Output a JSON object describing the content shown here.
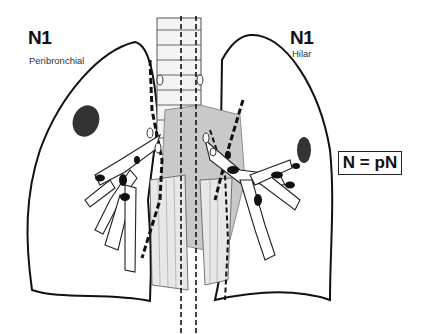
{
  "left_label": {
    "title": "N1",
    "subtitle": "Peribronchial"
  },
  "right_label": {
    "title": "N1",
    "subtitle": "Hilar"
  },
  "legend_box": "N = pN",
  "colors": {
    "line": "#111111",
    "shade": "#c9c9c9",
    "background": "#ffffff"
  }
}
